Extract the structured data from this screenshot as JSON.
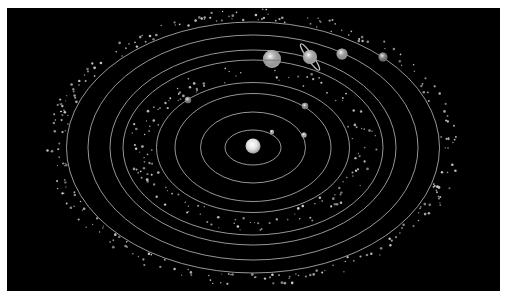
{
  "title": "Solar system diagram",
  "canvas": {
    "width": 513,
    "height": 298,
    "background": "#ffffff"
  },
  "panel": {
    "x": 7,
    "y": 8,
    "width": 493,
    "height": 283,
    "color": "#000000"
  },
  "colors": {
    "orbit": "#bdbdbd",
    "dust": "#cfcfcf"
  },
  "sun": {
    "name": "Sun",
    "cx": 253,
    "cy": 146,
    "r": 7.5
  },
  "orbit_center": {
    "cx": 253,
    "cy": 147.5
  },
  "orbits": [
    {
      "rx": 28,
      "ry": 17.5
    },
    {
      "rx": 52.5,
      "ry": 35.5
    },
    {
      "rx": 78,
      "ry": 54
    },
    {
      "rx": 96.5,
      "ry": 65
    },
    {
      "rx": 130,
      "ry": 87.5
    },
    {
      "rx": 143,
      "ry": 97.5
    },
    {
      "rx": 165,
      "ry": 112.5
    },
    {
      "rx": 186.5,
      "ry": 125.5
    }
  ],
  "planets": [
    {
      "name": "Mercury",
      "cx": 272,
      "cy": 132,
      "r": 2.2,
      "color": "#d8d8d8"
    },
    {
      "name": "Venus",
      "cx": 304,
      "cy": 135,
      "r": 2.6,
      "color": "#e6e6e6"
    },
    {
      "name": "Earth",
      "cx": 305,
      "cy": 106,
      "r": 3.2,
      "color": "#a9a9a9"
    },
    {
      "name": "Mars",
      "cx": 188,
      "cy": 100,
      "r": 3.2,
      "color": "#9a9a9a"
    },
    {
      "name": "Jupiter",
      "cx": 272,
      "cy": 59,
      "r": 9,
      "color": "#d9d9d9",
      "band": true
    },
    {
      "name": "Saturn",
      "cx": 310,
      "cy": 57,
      "r": 7,
      "color": "#dcdcdc",
      "ring": {
        "rx": 16,
        "ry": 3,
        "angle": 55
      }
    },
    {
      "name": "Uranus",
      "cx": 342,
      "cy": 54,
      "r": 5.5,
      "color": "#c8c8c8"
    },
    {
      "name": "Neptune",
      "cx": 383,
      "cy": 57,
      "r": 4.5,
      "color": "#8f8f8f"
    }
  ],
  "belts": [
    {
      "name": "Asteroid belt",
      "rx_min": 100,
      "rx_max": 124,
      "ry_ratio": 0.673,
      "count": 150,
      "seed": 7
    },
    {
      "name": "Kuiper belt",
      "rx_min": 188,
      "rx_max": 206,
      "ry_ratio": 0.673,
      "count": 260,
      "seed": 19
    }
  ]
}
